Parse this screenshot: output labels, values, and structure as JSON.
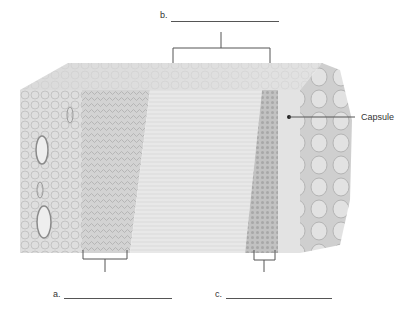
{
  "diagram": {
    "title": "",
    "labels": {
      "a": {
        "letter": "a.",
        "answer": ""
      },
      "b": {
        "letter": "b.",
        "answer": ""
      },
      "c": {
        "letter": "c.",
        "answer": ""
      },
      "capsule": {
        "text": "Capsule"
      }
    },
    "colors": {
      "background": "#ffffff",
      "line": "#555555",
      "tissue_light": "#e6e6e6",
      "tissue_mid": "#cfcfcf",
      "tissue_dark": "#b5b5b5",
      "capsule_side": "#d2d2d2"
    }
  }
}
